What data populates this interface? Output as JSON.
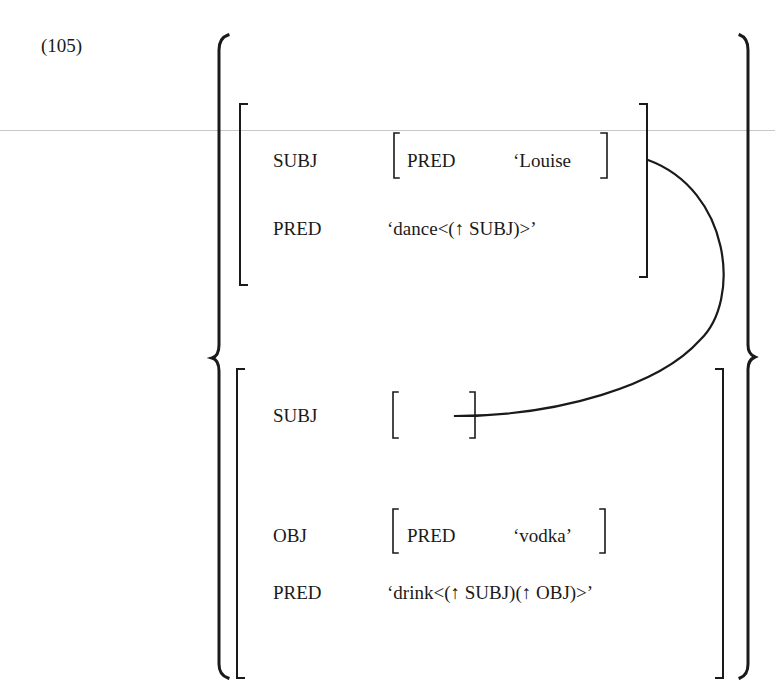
{
  "example_number": "(105)",
  "disjunction": {
    "upper_fstructure": {
      "rows": [
        {
          "attr": "SUBJ",
          "value": {
            "attr": "PRED",
            "value": "‘Louise"
          }
        },
        {
          "attr": "PRED",
          "value": "‘dance<(↑ SUBJ)>’"
        }
      ]
    },
    "lower_fstructure": {
      "rows": [
        {
          "attr": "SUBJ",
          "value": ""
        },
        {
          "attr": "OBJ",
          "value": {
            "attr": "PRED",
            "value": "‘vodka’"
          }
        },
        {
          "attr": "PRED",
          "value": "‘drink<(↑ SUBJ)(↑ OBJ)>’"
        }
      ]
    },
    "link": "structure-sharing curve from upper SUBJ to lower SUBJ"
  },
  "colors": {
    "ink": "#1a1a1a",
    "rule": "#c8c8c8",
    "background": "#ffffff"
  }
}
